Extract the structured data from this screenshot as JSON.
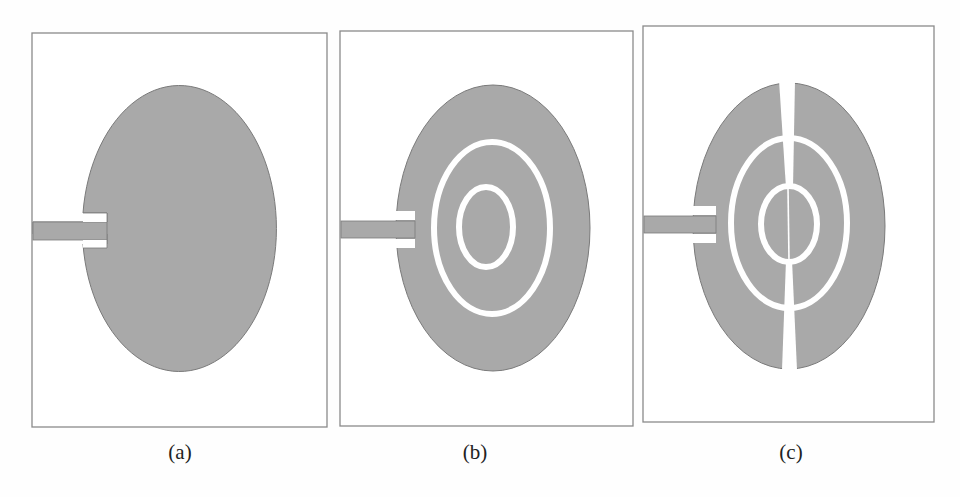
{
  "figure": {
    "panels": [
      {
        "id": "a",
        "label": "(a)",
        "description": "Elliptical monopole patch with microstrip feed line"
      },
      {
        "id": "b",
        "label": "(b)",
        "description": "Elliptical patch with two concentric elliptical ring slots"
      },
      {
        "id": "c",
        "label": "(c)",
        "description": "Elliptical patch with two concentric ring slots and a vertical split slot"
      }
    ],
    "colors": {
      "patch": "#a9a9a9",
      "patch_edge": "#7a7a7a",
      "substrate": "#ffffff",
      "border": "#8a8a8a",
      "label": "#222222"
    }
  }
}
